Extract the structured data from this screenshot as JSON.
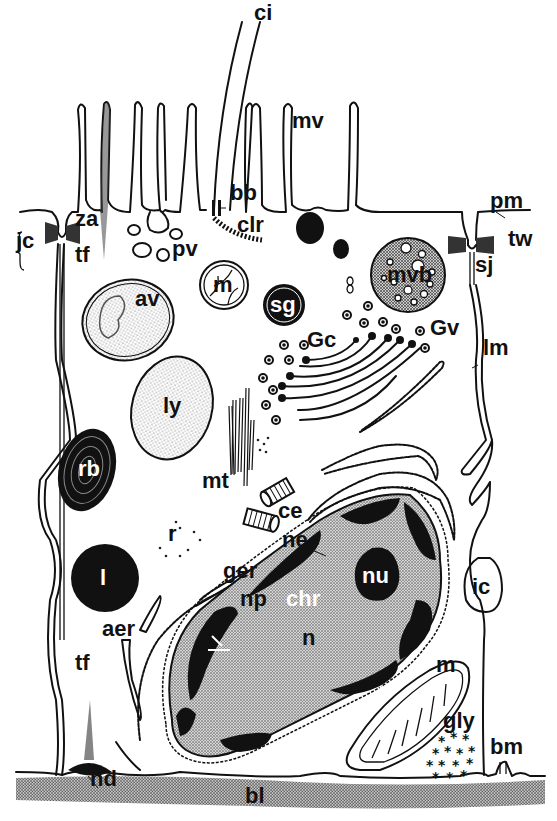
{
  "diagram": {
    "colors": {
      "ink": "#111111",
      "paper": "#ffffff",
      "stipple": "#bdbdbd",
      "basal_lamina": "#9a9a9a"
    },
    "labels": [
      {
        "id": "ci",
        "text": "ci",
        "meaning": "cilium",
        "x": 254,
        "y": 20
      },
      {
        "id": "mv",
        "text": "mv",
        "meaning": "microvilli",
        "x": 292,
        "y": 128
      },
      {
        "id": "bb",
        "text": "bb",
        "meaning": "basal body",
        "x": 230,
        "y": 200
      },
      {
        "id": "clr",
        "text": "clr",
        "meaning": "ciliary rootlet",
        "x": 237,
        "y": 232
      },
      {
        "id": "pm",
        "text": "pm",
        "meaning": "plasma membrane",
        "x": 490,
        "y": 208
      },
      {
        "id": "za",
        "text": "za",
        "meaning": "zonula adherens",
        "x": 75,
        "y": 226
      },
      {
        "id": "jc",
        "text": "jc",
        "meaning": "junctional complex",
        "x": 16,
        "y": 248
      },
      {
        "id": "tf",
        "text": "tf",
        "meaning": "tonofilaments",
        "x": 75,
        "y": 262
      },
      {
        "id": "pv",
        "text": "pv",
        "meaning": "pinocytotic vesicles",
        "x": 172,
        "y": 256
      },
      {
        "id": "tw",
        "text": "tw",
        "meaning": "terminal web",
        "x": 508,
        "y": 246
      },
      {
        "id": "sj",
        "text": "sj",
        "meaning": "septate junction",
        "x": 475,
        "y": 272
      },
      {
        "id": "m",
        "text": "m",
        "meaning": "mitochondrion",
        "x": 220,
        "y": 283
      },
      {
        "id": "mvb",
        "text": "mvb",
        "meaning": "multivesicular body",
        "x": 398,
        "y": 276
      },
      {
        "id": "av",
        "text": "av",
        "meaning": "autophagic vacuole",
        "x": 135,
        "y": 306
      },
      {
        "id": "sg",
        "text": "sg",
        "meaning": "secretory granule",
        "x": 268,
        "y": 311
      },
      {
        "id": "Gc",
        "text": "Gc",
        "meaning": "Golgi complex",
        "x": 307,
        "y": 347
      },
      {
        "id": "Gv",
        "text": "Gv",
        "meaning": "Golgi vesicles",
        "x": 430,
        "y": 335
      },
      {
        "id": "lm",
        "text": "lm",
        "meaning": "lateral membrane",
        "x": 483,
        "y": 355
      },
      {
        "id": "ly",
        "text": "ly",
        "meaning": "lysosome",
        "x": 163,
        "y": 413
      },
      {
        "id": "rb",
        "text": "rb",
        "meaning": "residual body",
        "x": 80,
        "y": 476
      },
      {
        "id": "mt",
        "text": "mt",
        "meaning": "microtubules",
        "x": 202,
        "y": 488
      },
      {
        "id": "ce",
        "text": "ce",
        "meaning": "centrioles",
        "x": 278,
        "y": 518
      },
      {
        "id": "ne",
        "text": "ne",
        "meaning": "nuclear envelope",
        "x": 282,
        "y": 547
      },
      {
        "id": "r",
        "text": "r",
        "meaning": "ribosomes",
        "x": 168,
        "y": 541
      },
      {
        "id": "ger",
        "text": "ger",
        "meaning": "granular endoplasmic reticulum",
        "x": 223,
        "y": 578
      },
      {
        "id": "nu",
        "text": "nu",
        "meaning": "nucleolus",
        "x": 362,
        "y": 583
      },
      {
        "id": "ic",
        "text": "ic",
        "meaning": "intercellular space",
        "x": 477,
        "y": 581
      },
      {
        "id": "l",
        "text": "l",
        "meaning": "lipid droplet",
        "x": 100,
        "y": 585
      },
      {
        "id": "np",
        "text": "np",
        "meaning": "nuclear pore",
        "x": 240,
        "y": 606
      },
      {
        "id": "chr",
        "text": "chr",
        "meaning": "chromatin",
        "x": 286,
        "y": 606
      },
      {
        "id": "aer",
        "text": "aer",
        "meaning": "agranular endoplasmic reticulum",
        "x": 102,
        "y": 636
      },
      {
        "id": "n",
        "text": "n",
        "meaning": "nucleus",
        "x": 302,
        "y": 645
      },
      {
        "id": "m2",
        "text": "m",
        "meaning": "mitochondrion",
        "x": 436,
        "y": 672
      },
      {
        "id": "tf2",
        "text": "tf",
        "meaning": "tonofilaments",
        "x": 75,
        "y": 670
      },
      {
        "id": "gly",
        "text": "gly",
        "meaning": "glycogen",
        "x": 443,
        "y": 728
      },
      {
        "id": "bm",
        "text": "bm",
        "meaning": "basal membrane infoldings",
        "x": 490,
        "y": 754
      },
      {
        "id": "hd",
        "text": "hd",
        "meaning": "hemidesmosome",
        "x": 90,
        "y": 786
      },
      {
        "id": "bl",
        "text": "bl",
        "meaning": "basal lamina",
        "x": 245,
        "y": 803
      }
    ]
  }
}
